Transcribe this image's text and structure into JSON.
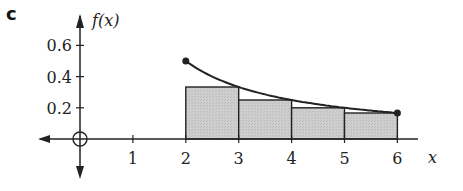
{
  "part_label": "c",
  "chart_data": {
    "type": "bar",
    "title": "",
    "xlabel": "x",
    "ylabel": "f(x)",
    "function": "f(x) = 1/x",
    "curve_domain": [
      2,
      6
    ],
    "curve_endpoints": [
      {
        "x": 2,
        "y": 0.5
      },
      {
        "x": 6,
        "y": 0.1667
      }
    ],
    "rectangles": [
      {
        "x0": 2,
        "x1": 3,
        "height": 0.3333
      },
      {
        "x0": 3,
        "x1": 4,
        "height": 0.25
      },
      {
        "x0": 4,
        "x1": 5,
        "height": 0.2
      },
      {
        "x0": 5,
        "x1": 6,
        "height": 0.1667
      }
    ],
    "categories": [
      "2-3",
      "3-4",
      "4-5",
      "5-6"
    ],
    "values": [
      0.333,
      0.25,
      0.2,
      0.167
    ],
    "x_ticks": [
      "1",
      "2",
      "3",
      "4",
      "5",
      "6"
    ],
    "y_ticks": [
      "0.2",
      "0.4",
      "0.6"
    ],
    "origin_label": "O",
    "xlim": [
      -0.7,
      7
    ],
    "ylim": [
      -0.2,
      0.7
    ],
    "grid": false,
    "legend": null,
    "colors": {
      "rect_fill": "#c8c8c8",
      "stroke": "#222222"
    }
  }
}
